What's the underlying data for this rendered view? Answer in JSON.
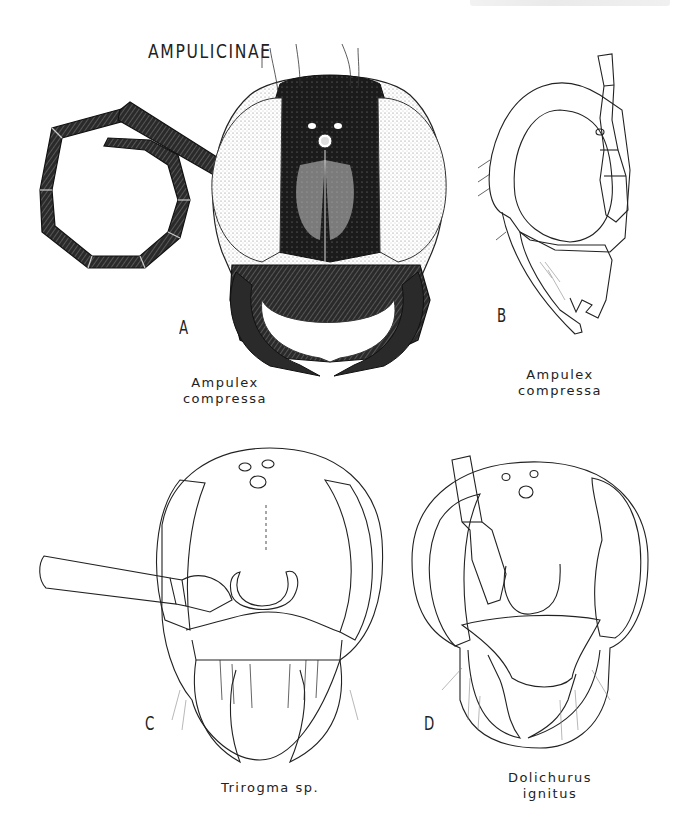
{
  "page": {
    "running_header": "",
    "section_title": "AMPULICINAE"
  },
  "figures": [
    {
      "letter": "A",
      "caption_line1": "Ampulex",
      "caption_line2": "compressa",
      "view": "frontal head, stippled"
    },
    {
      "letter": "B",
      "caption_line1": "Ampulex",
      "caption_line2": "compressa",
      "view": "lateral head, line drawing"
    },
    {
      "letter": "C",
      "caption_line1": "Trirogma sp.",
      "caption_line2": "",
      "view": "frontal head, line drawing"
    },
    {
      "letter": "D",
      "caption_line1": "Dolichurus",
      "caption_line2": "ignitus",
      "view": "frontal head, line drawing"
    }
  ],
  "colors": {
    "ink": "#1a1a1a",
    "paper": "#ffffff",
    "stipple": "#555555"
  }
}
